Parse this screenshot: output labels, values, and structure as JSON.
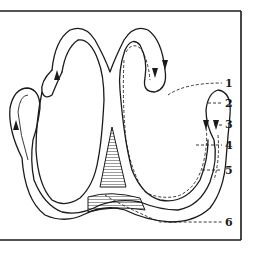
{
  "figure": {
    "type": "anatomical line diagram",
    "frame": {
      "top_y": 11,
      "bottom_y": 240,
      "right_x": 241
    },
    "labels": [
      {
        "id": "1",
        "text": "1",
        "x": 227,
        "y": 104
      },
      {
        "id": "2",
        "text": "2",
        "x": 227,
        "y": 122
      },
      {
        "id": "3",
        "text": "3",
        "x": 227,
        "y": 145
      },
      {
        "id": "4",
        "text": "4",
        "x": 227,
        "y": 145
      },
      {
        "id": "5",
        "text": "5",
        "x": 227,
        "y": 170
      },
      {
        "id": "6",
        "text": "6",
        "x": 227,
        "y": 226
      }
    ],
    "colors": {
      "ink": "#1a1a1a",
      "paper": "#ffffff"
    }
  }
}
